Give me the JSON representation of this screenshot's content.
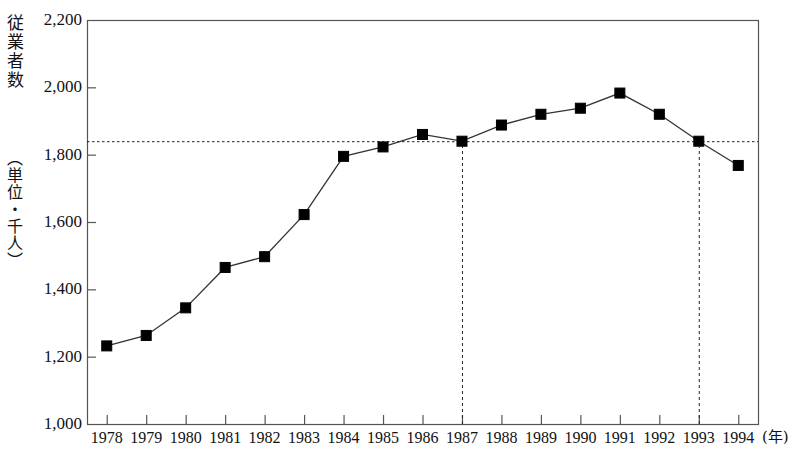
{
  "chart_data": {
    "type": "line",
    "title": "",
    "subtitle": "",
    "ylabel": "従業者数",
    "ylabel_unit": "（単位・千人）",
    "xlabel": "(年)",
    "xlabel_full": "年",
    "categories": [
      "1978",
      "1979",
      "1980",
      "1981",
      "1982",
      "1983",
      "1984",
      "1985",
      "1986",
      "1987",
      "1988",
      "1989",
      "1990",
      "1991",
      "1992",
      "1993",
      "1994"
    ],
    "series": [
      {
        "name": "従業者数",
        "marker": "filled-square",
        "color": "#000000",
        "values": [
          1232,
          1263,
          1345,
          1465,
          1497,
          1622,
          1795,
          1823,
          1860,
          1840,
          1888,
          1920,
          1938,
          1983,
          1920,
          1840,
          1768
        ]
      }
    ],
    "ylim": [
      1000,
      2200
    ],
    "yticks": [
      1000,
      1200,
      1400,
      1600,
      1800,
      2000,
      2200
    ],
    "ytick_labels": [
      "1,000",
      "1,200",
      "1,400",
      "1,600",
      "1,800",
      "2,000",
      "2,200"
    ],
    "xtick_labels": [
      "1978",
      "1979",
      "1980",
      "1981",
      "1982",
      "1983",
      "1984",
      "1985",
      "1986",
      "1987",
      "1988",
      "1989",
      "1990",
      "1991",
      "1992",
      "1993",
      "1994"
    ],
    "grid": false,
    "legend": "none",
    "annotations": [
      {
        "type": "hline",
        "name": "reference-level-line",
        "value": 1840,
        "style": "dotted",
        "x_from": "1987",
        "x_to": "1993"
      },
      {
        "type": "vline",
        "name": "reference-year-line-1987",
        "category": "1987",
        "style": "dashed",
        "from_value": 1000,
        "to_value": 1840
      },
      {
        "type": "vline",
        "name": "reference-year-line-1993",
        "category": "1993",
        "style": "dashed",
        "from_value": 1000,
        "to_value": 1840
      }
    ],
    "plot_area": {
      "left_px": 87,
      "right_px": 758,
      "top_px": 20,
      "bottom_px": 424
    },
    "style": {
      "frame_color": "#555555",
      "line_color": "#333333",
      "marker_color": "#000000",
      "background": "#ffffff"
    }
  }
}
